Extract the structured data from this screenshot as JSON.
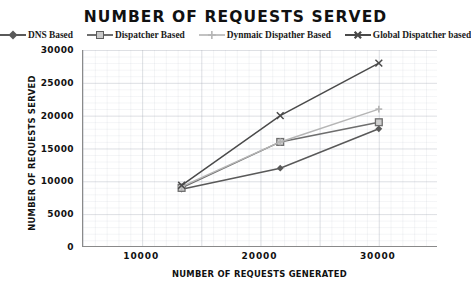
{
  "chart_data": {
    "type": "line",
    "title": "NUMBER OF REQUESTS SERVED",
    "xlabel": "NUMBER OF REQUESTS GENERATED",
    "ylabel": "NUMBER OF REQUESTS SERVED",
    "x": [
      10000,
      20000,
      30000
    ],
    "categories": [
      "10000",
      "20000",
      "30000"
    ],
    "xlim": [
      0,
      36000
    ],
    "ylim": [
      0,
      30000
    ],
    "grid": true,
    "legend_position": "top",
    "xticks": [
      "10000",
      "20000",
      "30000"
    ],
    "yticks": [
      "0",
      "5000",
      "10000",
      "15000",
      "20000",
      "25000",
      "30000"
    ],
    "ytick_values": [
      0,
      5000,
      10000,
      15000,
      20000,
      25000,
      30000
    ],
    "series": [
      {
        "name": "DNS Based",
        "values": [
          8800,
          12000,
          18000
        ],
        "color": "#595959",
        "marker": "diamond"
      },
      {
        "name": "Dispatcher Based",
        "values": [
          9000,
          16000,
          19000
        ],
        "color": "#6e6e6e",
        "marker": "square"
      },
      {
        "name": "Dynmaic Dispather Based",
        "values": [
          9200,
          16000,
          21000
        ],
        "color": "#b5b5b5",
        "marker": "cross"
      },
      {
        "name": "Global Dispatcher based",
        "values": [
          9400,
          20000,
          28000
        ],
        "color": "#4a4a4a",
        "marker": "x"
      }
    ]
  }
}
